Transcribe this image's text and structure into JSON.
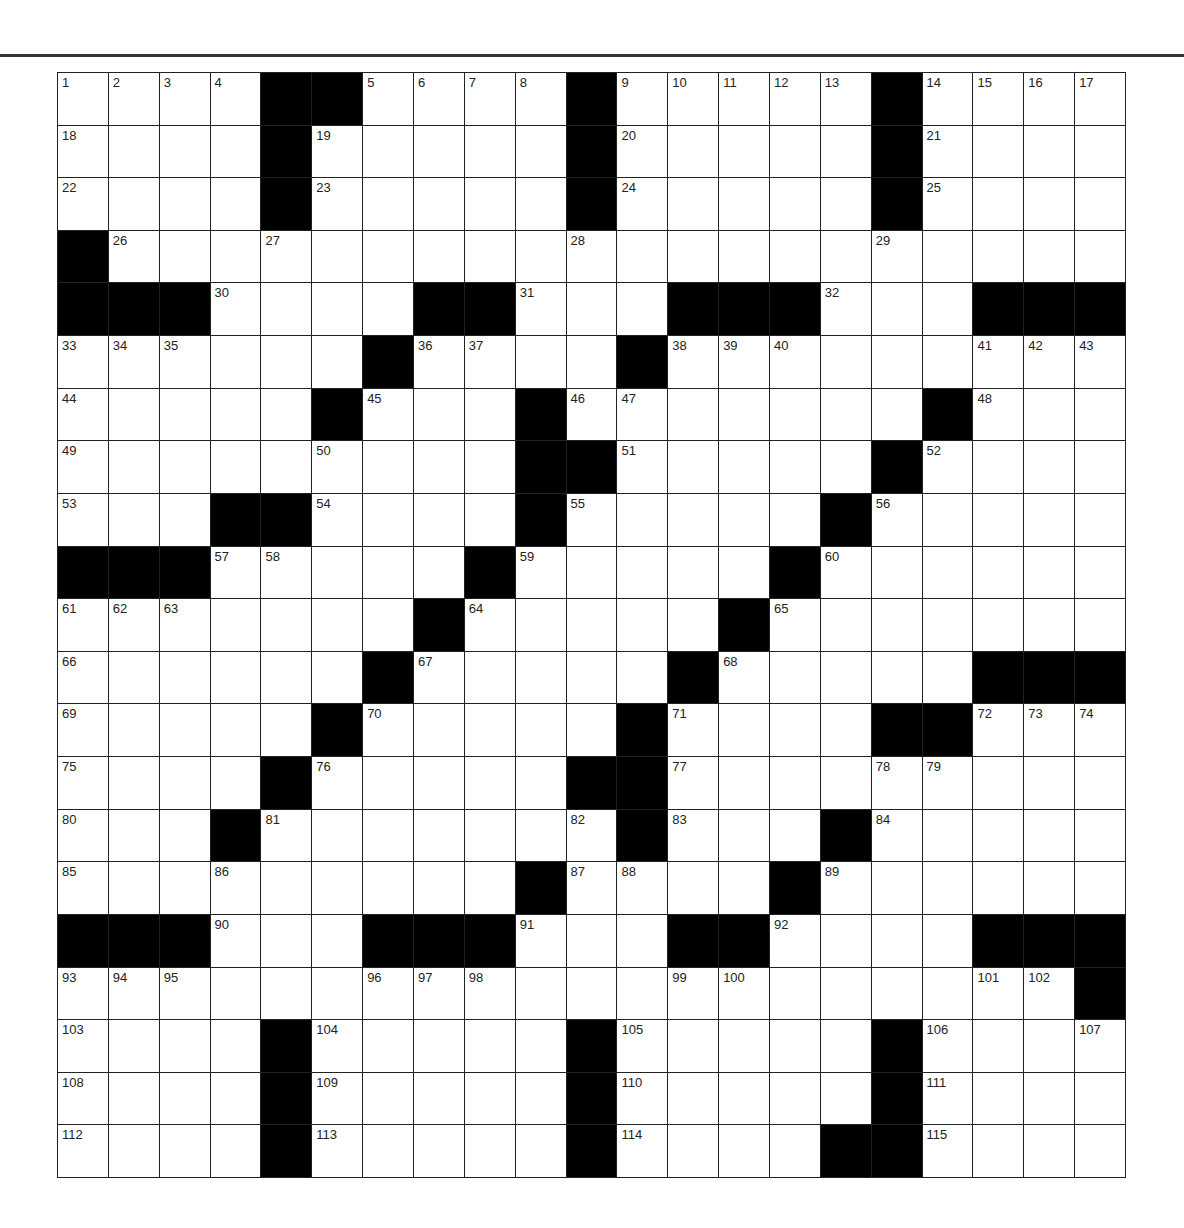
{
  "puzzle": {
    "size": {
      "rows": 21,
      "cols": 21
    },
    "colors": {
      "black_square": "#000000",
      "white_square": "#ffffff",
      "grid_line": "#222222",
      "rule": "#333333"
    },
    "grid": [
      "....##....#.....#....",
      "....#.....#.....#....",
      "....#.....#.....#....",
      "#....................",
      "###....##...###...###",
      "......#....#.........",
      ".....#...#.......#...",
      ".........##.....#....",
      "...##....#.....#.....",
      "###.....#.....#......",
      ".......#.....#.......",
      "......#.....#.....###",
      ".....#.....#....##...",
      "....#.....##.........",
      "...#.......#...#.....",
      ".........#....#......",
      "###...###...##....###",
      "....................#",
      "....#.....#.....#....",
      "....#.....#.....#....",
      "....#.....#....##...."
    ],
    "numbers": [
      [
        0,
        0,
        1
      ],
      [
        0,
        1,
        2
      ],
      [
        0,
        2,
        3
      ],
      [
        0,
        3,
        4
      ],
      [
        0,
        6,
        5
      ],
      [
        0,
        7,
        6
      ],
      [
        0,
        8,
        7
      ],
      [
        0,
        9,
        8
      ],
      [
        0,
        11,
        9
      ],
      [
        0,
        12,
        10
      ],
      [
        0,
        13,
        11
      ],
      [
        0,
        14,
        12
      ],
      [
        0,
        15,
        13
      ],
      [
        0,
        17,
        14
      ],
      [
        0,
        18,
        15
      ],
      [
        0,
        19,
        16
      ],
      [
        0,
        20,
        17
      ],
      [
        1,
        0,
        18
      ],
      [
        1,
        5,
        19
      ],
      [
        1,
        11,
        20
      ],
      [
        1,
        17,
        21
      ],
      [
        2,
        0,
        22
      ],
      [
        2,
        5,
        23
      ],
      [
        2,
        11,
        24
      ],
      [
        2,
        17,
        25
      ],
      [
        3,
        1,
        26
      ],
      [
        3,
        4,
        27
      ],
      [
        3,
        10,
        28
      ],
      [
        3,
        16,
        29
      ],
      [
        4,
        3,
        30
      ],
      [
        4,
        9,
        31
      ],
      [
        4,
        15,
        32
      ],
      [
        5,
        0,
        33
      ],
      [
        5,
        1,
        34
      ],
      [
        5,
        2,
        35
      ],
      [
        5,
        7,
        36
      ],
      [
        5,
        8,
        37
      ],
      [
        5,
        12,
        38
      ],
      [
        5,
        13,
        39
      ],
      [
        5,
        14,
        40
      ],
      [
        5,
        18,
        41
      ],
      [
        5,
        19,
        42
      ],
      [
        5,
        20,
        43
      ],
      [
        6,
        0,
        44
      ],
      [
        6,
        6,
        45
      ],
      [
        6,
        10,
        46
      ],
      [
        6,
        11,
        47
      ],
      [
        6,
        18,
        48
      ],
      [
        7,
        0,
        49
      ],
      [
        7,
        5,
        50
      ],
      [
        7,
        11,
        51
      ],
      [
        7,
        17,
        52
      ],
      [
        8,
        0,
        53
      ],
      [
        8,
        5,
        54
      ],
      [
        8,
        10,
        55
      ],
      [
        8,
        16,
        56
      ],
      [
        9,
        3,
        57
      ],
      [
        9,
        4,
        58
      ],
      [
        9,
        9,
        59
      ],
      [
        9,
        15,
        60
      ],
      [
        10,
        0,
        61
      ],
      [
        10,
        1,
        62
      ],
      [
        10,
        2,
        63
      ],
      [
        10,
        8,
        64
      ],
      [
        10,
        14,
        65
      ],
      [
        11,
        0,
        66
      ],
      [
        11,
        7,
        67
      ],
      [
        11,
        13,
        68
      ],
      [
        12,
        0,
        69
      ],
      [
        12,
        6,
        70
      ],
      [
        12,
        12,
        71
      ],
      [
        12,
        18,
        72
      ],
      [
        12,
        19,
        73
      ],
      [
        12,
        20,
        74
      ],
      [
        13,
        0,
        75
      ],
      [
        13,
        5,
        76
      ],
      [
        13,
        12,
        77
      ],
      [
        13,
        16,
        78
      ],
      [
        13,
        17,
        79
      ],
      [
        14,
        0,
        80
      ],
      [
        14,
        4,
        81
      ],
      [
        14,
        10,
        82
      ],
      [
        14,
        12,
        83
      ],
      [
        14,
        16,
        84
      ],
      [
        15,
        0,
        85
      ],
      [
        15,
        3,
        86
      ],
      [
        15,
        10,
        87
      ],
      [
        15,
        11,
        88
      ],
      [
        15,
        15,
        89
      ],
      [
        16,
        3,
        90
      ],
      [
        16,
        9,
        91
      ],
      [
        16,
        14,
        92
      ],
      [
        17,
        0,
        93
      ],
      [
        17,
        1,
        94
      ],
      [
        17,
        2,
        95
      ],
      [
        17,
        6,
        96
      ],
      [
        17,
        7,
        97
      ],
      [
        17,
        8,
        98
      ],
      [
        17,
        12,
        99
      ],
      [
        17,
        13,
        100
      ],
      [
        17,
        18,
        101
      ],
      [
        17,
        19,
        102
      ],
      [
        18,
        0,
        103
      ],
      [
        18,
        5,
        104
      ],
      [
        18,
        11,
        105
      ],
      [
        18,
        17,
        106
      ],
      [
        18,
        20,
        107
      ],
      [
        19,
        0,
        108
      ],
      [
        19,
        5,
        109
      ],
      [
        19,
        11,
        110
      ],
      [
        19,
        17,
        111
      ],
      [
        20,
        0,
        112
      ],
      [
        20,
        5,
        113
      ],
      [
        20,
        11,
        114
      ],
      [
        20,
        17,
        115
      ]
    ],
    "entries": {}
  }
}
